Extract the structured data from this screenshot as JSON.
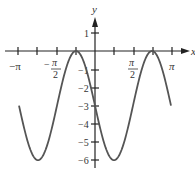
{
  "chart_data": {
    "type": "line",
    "title": "",
    "function": "y = -3 sin(2x) - 3",
    "xlabel": "x",
    "ylabel": "y",
    "xlim": [
      -3.1416,
      3.1416
    ],
    "ylim": [
      -6,
      1
    ],
    "x_ticks": [
      -3.1416,
      -2.3562,
      -1.5708,
      -0.7854,
      0.7854,
      1.5708,
      2.3562,
      3.1416
    ],
    "x_tick_labels": [
      {
        "value": -3.1416,
        "label": "−π"
      },
      {
        "value": -1.5708,
        "label": "−π/2"
      },
      {
        "value": 1.5708,
        "label": "π/2"
      },
      {
        "value": 3.1416,
        "label": "π"
      }
    ],
    "y_ticks": [
      1,
      -1,
      -2,
      -3,
      -4,
      -5,
      -6
    ],
    "y_tick_labels": [
      "1",
      "−1",
      "−2",
      "−3",
      "−4",
      "−5",
      "−6"
    ],
    "series": [
      {
        "name": "curve",
        "x": [
          -3.1416,
          -2.3562,
          -1.5708,
          -0.7854,
          0,
          0.7854,
          1.5708,
          2.3562,
          3.1416
        ],
        "y": [
          -3,
          -6,
          -3,
          0,
          -3,
          -6,
          -3,
          0,
          -3
        ]
      }
    ],
    "grid": false,
    "legend": null
  },
  "labels": {
    "x_axis": "x",
    "y_axis": "y",
    "neg_pi": "−π",
    "neg_half_pi_num": "π",
    "neg_half_pi_den": "2",
    "half_pi_num": "π",
    "half_pi_den": "2",
    "pi": "π",
    "y1": "1",
    "ym1": "−1",
    "ym2": "−2",
    "ym3": "−3",
    "ym4": "−4",
    "ym5": "−5",
    "ym6": "−6"
  }
}
